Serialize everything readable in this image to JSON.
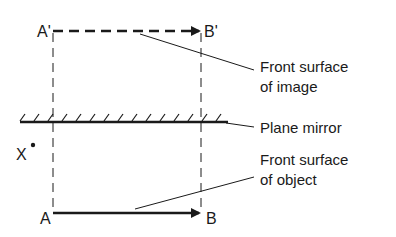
{
  "diagram": {
    "points": {
      "a_prime": "A'",
      "b_prime": "B'",
      "a": "A",
      "b": "B",
      "x": "X"
    },
    "labels": {
      "image_line1": "Front surface",
      "image_line2": "of image",
      "mirror": "Plane mirror",
      "object_line1": "Front surface",
      "object_line2": "of object"
    },
    "colors": {
      "ink": "#1a1a1a",
      "background": "#ffffff"
    }
  }
}
